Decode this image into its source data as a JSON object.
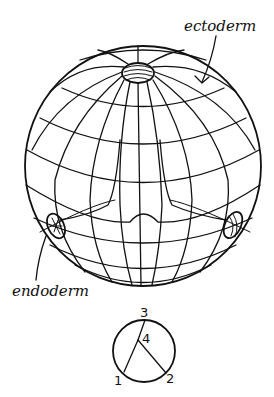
{
  "figure": {
    "type": "embryo sphere diagram (early gastrula)",
    "labels": {
      "ectoderm": "ectoderm",
      "endoderm": "endoderm"
    },
    "orientation_key": {
      "points": [
        {
          "id": "1",
          "label": "1"
        },
        {
          "id": "2",
          "label": "2"
        },
        {
          "id": "3",
          "label": "3"
        },
        {
          "id": "4",
          "label": "4"
        }
      ]
    },
    "colors": {
      "ink": "#111111",
      "background": "#ffffff"
    }
  }
}
